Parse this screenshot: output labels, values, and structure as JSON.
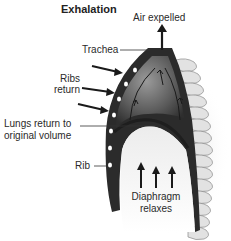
{
  "diagram": {
    "title": "Exhalation",
    "labels": {
      "air_expelled": "Air expelled",
      "trachea": "Trachea",
      "ribs_return_line1": "Ribs",
      "ribs_return_line2": "return",
      "lungs_line1": "Lungs return to",
      "lungs_line2": "original volume",
      "rib": "Rib",
      "diaphragm_line1": "Diaphragm",
      "diaphragm_line2": "relaxes"
    },
    "colors": {
      "background": "#ffffff",
      "chest_dark": "#2b2b2b",
      "lung_fill": "#6a6a6a",
      "spine": "#dcdcdc",
      "arrow": "#222222",
      "text": "#2a2a2a"
    }
  }
}
